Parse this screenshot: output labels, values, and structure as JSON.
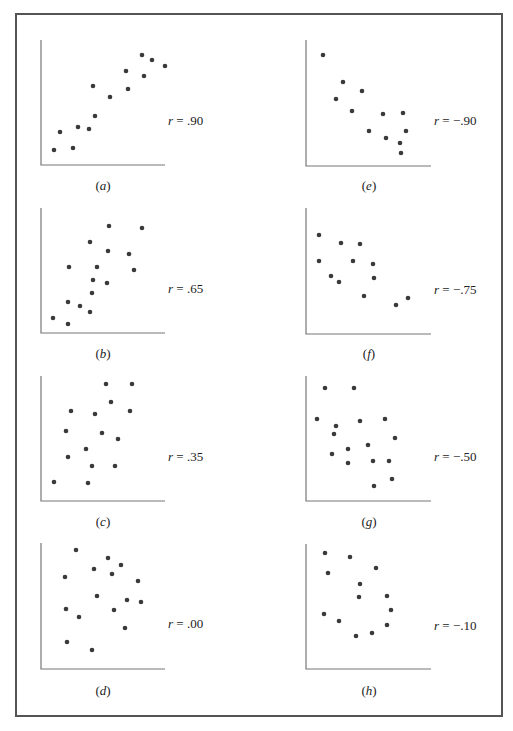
{
  "chart_data": [
    {
      "type": "scatter",
      "panel": "a",
      "caption": "(a)",
      "r_label": "r = .90",
      "r": 0.9,
      "axis": {
        "x0": 41,
        "y0": 165,
        "x1": 165,
        "ytop": 40
      },
      "label_pos": {
        "x": 168,
        "y": 125
      },
      "caption_pos": {
        "x": 103,
        "y": 190
      },
      "points": [
        [
          54,
          150
        ],
        [
          60,
          132
        ],
        [
          73,
          148
        ],
        [
          78,
          127
        ],
        [
          89,
          129
        ],
        [
          95,
          116
        ],
        [
          93,
          86
        ],
        [
          110,
          97
        ],
        [
          126,
          71
        ],
        [
          128,
          89
        ],
        [
          142,
          55
        ],
        [
          144,
          76
        ],
        [
          152,
          60
        ],
        [
          165,
          66
        ]
      ]
    },
    {
      "type": "scatter",
      "panel": "b",
      "caption": "(b)",
      "r_label": "r = .65",
      "r": 0.65,
      "axis": {
        "x0": 41,
        "y0": 333,
        "x1": 165,
        "ytop": 208
      },
      "label_pos": {
        "x": 168,
        "y": 293
      },
      "caption_pos": {
        "x": 103,
        "y": 358
      },
      "points": [
        [
          53,
          318
        ],
        [
          68,
          324
        ],
        [
          68,
          302
        ],
        [
          80,
          306
        ],
        [
          69,
          267
        ],
        [
          90,
          312
        ],
        [
          90,
          242
        ],
        [
          92,
          293
        ],
        [
          93,
          280
        ],
        [
          97,
          267
        ],
        [
          107,
          283
        ],
        [
          108,
          251
        ],
        [
          109,
          226
        ],
        [
          129,
          254
        ],
        [
          134,
          270
        ],
        [
          142,
          228
        ]
      ]
    },
    {
      "type": "scatter",
      "panel": "c",
      "caption": "(c)",
      "r_label": "r = .35",
      "r": 0.35,
      "axis": {
        "x0": 41,
        "y0": 501,
        "x1": 165,
        "ytop": 376
      },
      "label_pos": {
        "x": 168,
        "y": 461
      },
      "caption_pos": {
        "x": 103,
        "y": 526
      },
      "points": [
        [
          54,
          482
        ],
        [
          68,
          457
        ],
        [
          66,
          431
        ],
        [
          71,
          411
        ],
        [
          86,
          449
        ],
        [
          88,
          483
        ],
        [
          92,
          466
        ],
        [
          95,
          414
        ],
        [
          102,
          433
        ],
        [
          106,
          384
        ],
        [
          111,
          402
        ],
        [
          115,
          466
        ],
        [
          118,
          439
        ],
        [
          130,
          411
        ],
        [
          132,
          384
        ]
      ]
    },
    {
      "type": "scatter",
      "panel": "d",
      "caption": "(d)",
      "r_label": "r = .00",
      "r": 0.0,
      "axis": {
        "x0": 41,
        "y0": 669,
        "x1": 165,
        "ytop": 543
      },
      "label_pos": {
        "x": 168,
        "y": 628
      },
      "caption_pos": {
        "x": 103,
        "y": 695
      },
      "points": [
        [
          76,
          550
        ],
        [
          65,
          577
        ],
        [
          94,
          569
        ],
        [
          108,
          558
        ],
        [
          112,
          574
        ],
        [
          121,
          565
        ],
        [
          138,
          581
        ],
        [
          97,
          596
        ],
        [
          66,
          609
        ],
        [
          79,
          617
        ],
        [
          114,
          610
        ],
        [
          127,
          600
        ],
        [
          141,
          602
        ],
        [
          125,
          628
        ],
        [
          67,
          642
        ],
        [
          92,
          650
        ]
      ]
    },
    {
      "type": "scatter",
      "panel": "e",
      "caption": "(e)",
      "r_label": "r = -.90",
      "r": -0.9,
      "axis": {
        "x0": 306,
        "y0": 166,
        "x1": 431,
        "ytop": 40
      },
      "label_pos": {
        "x": 434,
        "y": 125
      },
      "caption_pos": {
        "x": 369,
        "y": 190
      },
      "points": [
        [
          323,
          55
        ],
        [
          343,
          82
        ],
        [
          336,
          99
        ],
        [
          362,
          91
        ],
        [
          352,
          111
        ],
        [
          383,
          114
        ],
        [
          403,
          113
        ],
        [
          369,
          131
        ],
        [
          386,
          138
        ],
        [
          406,
          131
        ],
        [
          400,
          143
        ],
        [
          401,
          153
        ]
      ]
    },
    {
      "type": "scatter",
      "panel": "f",
      "caption": "(f)",
      "r_label": "r = -.75",
      "r": -0.75,
      "axis": {
        "x0": 306,
        "y0": 334,
        "x1": 431,
        "ytop": 208
      },
      "label_pos": {
        "x": 434,
        "y": 294
      },
      "caption_pos": {
        "x": 369,
        "y": 358
      },
      "points": [
        [
          319,
          235
        ],
        [
          341,
          243
        ],
        [
          360,
          244
        ],
        [
          319,
          261
        ],
        [
          353,
          261
        ],
        [
          373,
          264
        ],
        [
          331,
          276
        ],
        [
          339,
          282
        ],
        [
          374,
          278
        ],
        [
          364,
          296
        ],
        [
          396,
          305
        ],
        [
          408,
          298
        ]
      ]
    },
    {
      "type": "scatter",
      "panel": "g",
      "caption": "(g)",
      "r_label": "r = -.50",
      "r": -0.5,
      "axis": {
        "x0": 306,
        "y0": 501,
        "x1": 431,
        "ytop": 376
      },
      "label_pos": {
        "x": 434,
        "y": 461
      },
      "caption_pos": {
        "x": 369,
        "y": 526
      },
      "points": [
        [
          325,
          388
        ],
        [
          354,
          388
        ],
        [
          317,
          419
        ],
        [
          336,
          426
        ],
        [
          334,
          434
        ],
        [
          360,
          421
        ],
        [
          385,
          419
        ],
        [
          395,
          438
        ],
        [
          348,
          449
        ],
        [
          368,
          445
        ],
        [
          332,
          454
        ],
        [
          348,
          463
        ],
        [
          373,
          461
        ],
        [
          389,
          461
        ],
        [
          374,
          486
        ],
        [
          392,
          479
        ]
      ]
    },
    {
      "type": "scatter",
      "panel": "h",
      "caption": "(h)",
      "r_label": "r = -.10",
      "r": -0.1,
      "axis": {
        "x0": 306,
        "y0": 669,
        "x1": 431,
        "ytop": 544
      },
      "label_pos": {
        "x": 434,
        "y": 630
      },
      "caption_pos": {
        "x": 369,
        "y": 695
      },
      "points": [
        [
          325,
          553
        ],
        [
          350,
          557
        ],
        [
          328,
          573
        ],
        [
          376,
          568
        ],
        [
          360,
          584
        ],
        [
          359,
          597
        ],
        [
          387,
          596
        ],
        [
          391,
          610
        ],
        [
          324,
          614
        ],
        [
          339,
          621
        ],
        [
          387,
          625
        ],
        [
          356,
          636
        ],
        [
          372,
          633
        ]
      ]
    }
  ]
}
